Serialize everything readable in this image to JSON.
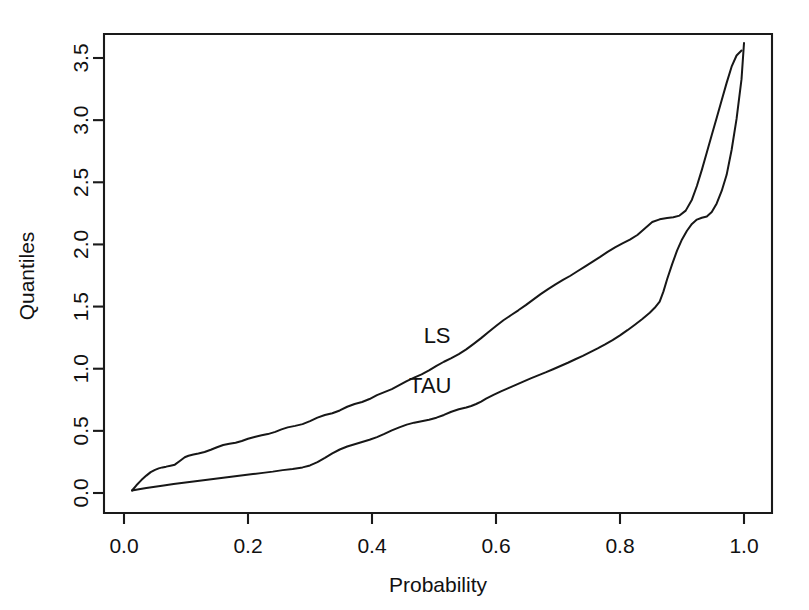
{
  "chart_data": {
    "type": "line",
    "title": "",
    "xlabel": "Probability",
    "ylabel": "Quantiles",
    "xlim": [
      -0.016,
      1.056
    ],
    "ylim": [
      -0.118,
      3.618
    ],
    "grid": false,
    "legend": "inline-annotations",
    "xticks": [
      "0.0",
      "0.2",
      "0.4",
      "0.6",
      "0.8",
      "1.0"
    ],
    "xtick_values": [
      0.0,
      0.2,
      0.4,
      0.6,
      0.8,
      1.0
    ],
    "yticks": [
      "0.0",
      "0.5",
      "1.0",
      "1.5",
      "2.0",
      "2.5",
      "3.0",
      "3.5"
    ],
    "ytick_values": [
      0.0,
      0.5,
      1.0,
      1.5,
      2.0,
      2.5,
      3.0,
      3.5
    ],
    "series": [
      {
        "name": "LS",
        "label_x": 0.505,
        "label_y": 1.255,
        "x": [
          0.013,
          0.02,
          0.028,
          0.036,
          0.043,
          0.05,
          0.056,
          0.062,
          0.068,
          0.075,
          0.082,
          0.09,
          0.098,
          0.104,
          0.112,
          0.12,
          0.13,
          0.14,
          0.15,
          0.16,
          0.17,
          0.18,
          0.19,
          0.2,
          0.212,
          0.222,
          0.232,
          0.244,
          0.254,
          0.264,
          0.276,
          0.288,
          0.3,
          0.312,
          0.324,
          0.336,
          0.348,
          0.36,
          0.372,
          0.384,
          0.396,
          0.408,
          0.42,
          0.432,
          0.444,
          0.456,
          0.468,
          0.48,
          0.492,
          0.504,
          0.516,
          0.528,
          0.54,
          0.552,
          0.564,
          0.576,
          0.588,
          0.6,
          0.612,
          0.624,
          0.636,
          0.648,
          0.66,
          0.672,
          0.684,
          0.696,
          0.708,
          0.72,
          0.732,
          0.744,
          0.756,
          0.768,
          0.78,
          0.792,
          0.804,
          0.816,
          0.828,
          0.84,
          0.852,
          0.864,
          0.876,
          0.886,
          0.896,
          0.906,
          0.916,
          0.924,
          0.932,
          0.94,
          0.948,
          0.956,
          0.964,
          0.972,
          0.98,
          0.988,
          0.996
        ],
        "y": [
          0.02,
          0.062,
          0.104,
          0.14,
          0.168,
          0.186,
          0.198,
          0.206,
          0.212,
          0.22,
          0.228,
          0.258,
          0.288,
          0.3,
          0.31,
          0.318,
          0.33,
          0.348,
          0.368,
          0.386,
          0.396,
          0.404,
          0.418,
          0.436,
          0.452,
          0.464,
          0.474,
          0.492,
          0.512,
          0.528,
          0.54,
          0.554,
          0.578,
          0.606,
          0.628,
          0.642,
          0.664,
          0.694,
          0.716,
          0.732,
          0.756,
          0.788,
          0.812,
          0.836,
          0.868,
          0.9,
          0.928,
          0.954,
          0.986,
          1.022,
          1.056,
          1.086,
          1.118,
          1.156,
          1.2,
          1.246,
          1.296,
          1.344,
          1.39,
          1.43,
          1.47,
          1.512,
          1.556,
          1.6,
          1.64,
          1.678,
          1.714,
          1.748,
          1.786,
          1.824,
          1.862,
          1.9,
          1.94,
          1.976,
          2.008,
          2.038,
          2.076,
          2.128,
          2.18,
          2.202,
          2.212,
          2.218,
          2.232,
          2.272,
          2.36,
          2.47,
          2.6,
          2.74,
          2.88,
          3.02,
          3.16,
          3.3,
          3.43,
          3.52,
          3.56
        ],
        "endpoint_note": "Last point at (0.996, 3.56) near top-right; curve exits plot top"
      },
      {
        "name": "TAU",
        "label_x": 0.494,
        "label_y": 0.855,
        "x": [
          0.013,
          0.024,
          0.036,
          0.05,
          0.064,
          0.08,
          0.096,
          0.112,
          0.128,
          0.144,
          0.16,
          0.176,
          0.192,
          0.208,
          0.224,
          0.24,
          0.256,
          0.272,
          0.288,
          0.3,
          0.312,
          0.324,
          0.336,
          0.348,
          0.36,
          0.372,
          0.384,
          0.396,
          0.408,
          0.42,
          0.432,
          0.444,
          0.456,
          0.468,
          0.48,
          0.492,
          0.504,
          0.516,
          0.528,
          0.54,
          0.552,
          0.56,
          0.568,
          0.576,
          0.584,
          0.596,
          0.608,
          0.62,
          0.632,
          0.644,
          0.656,
          0.668,
          0.68,
          0.692,
          0.704,
          0.716,
          0.728,
          0.74,
          0.752,
          0.764,
          0.776,
          0.788,
          0.8,
          0.812,
          0.824,
          0.836,
          0.848,
          0.856,
          0.864,
          0.87,
          0.876,
          0.884,
          0.892,
          0.9,
          0.908,
          0.916,
          0.924,
          0.932,
          0.94,
          0.948,
          0.956,
          0.964,
          0.972,
          0.98,
          0.988,
          0.996,
          1.0
        ],
        "y": [
          0.02,
          0.03,
          0.04,
          0.05,
          0.06,
          0.072,
          0.082,
          0.092,
          0.102,
          0.112,
          0.122,
          0.132,
          0.142,
          0.152,
          0.162,
          0.172,
          0.184,
          0.194,
          0.206,
          0.222,
          0.248,
          0.282,
          0.318,
          0.35,
          0.374,
          0.392,
          0.41,
          0.428,
          0.45,
          0.476,
          0.504,
          0.528,
          0.55,
          0.566,
          0.578,
          0.59,
          0.606,
          0.628,
          0.654,
          0.674,
          0.688,
          0.7,
          0.716,
          0.736,
          0.76,
          0.79,
          0.818,
          0.844,
          0.87,
          0.896,
          0.922,
          0.946,
          0.97,
          0.996,
          1.022,
          1.048,
          1.076,
          1.104,
          1.134,
          1.164,
          1.196,
          1.23,
          1.268,
          1.31,
          1.354,
          1.4,
          1.45,
          1.49,
          1.54,
          1.62,
          1.72,
          1.84,
          1.95,
          2.04,
          2.11,
          2.165,
          2.2,
          2.215,
          2.225,
          2.26,
          2.33,
          2.43,
          2.56,
          2.76,
          3.01,
          3.33,
          3.62
        ],
        "endpoint_note": "Rises steeply at the right, exits the top of the panel"
      }
    ]
  },
  "annotations": {
    "ls_label": "LS",
    "tau_label": "TAU"
  },
  "axes": {
    "x_title": "Probability",
    "y_title": "Quantiles"
  },
  "colors": {
    "line": "#171717",
    "axis": "#1a1a1a",
    "background": "#ffffff",
    "text": "#111111"
  }
}
